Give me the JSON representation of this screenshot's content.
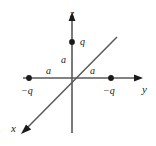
{
  "figure": {
    "background_color": "#ffffff",
    "axis_color": "#595959",
    "dot_color": "#1a1a1a",
    "text_color": "#1a1a1a",
    "width": 156,
    "height": 146
  },
  "axes": [
    {
      "name": "z",
      "label": "z",
      "direction": "up",
      "has_arrow": true
    },
    {
      "name": "y",
      "label": "y",
      "direction": "right",
      "has_arrow": true
    },
    {
      "name": "x",
      "label": "x",
      "direction": "down-left",
      "has_arrow": true
    }
  ],
  "charges": [
    {
      "id": "q-top",
      "label": "q",
      "axis": "z",
      "position": "+a",
      "sign": "positive"
    },
    {
      "id": "nq-left",
      "label": "−q",
      "axis": "y",
      "position": "−a",
      "sign": "negative"
    },
    {
      "id": "nq-right",
      "label": "−q",
      "axis": "y",
      "position": "+a",
      "sign": "negative"
    }
  ],
  "distances": [
    {
      "id": "a-z",
      "label": "a",
      "between": "origin to q on z-axis"
    },
    {
      "id": "a-left",
      "label": "a",
      "between": "origin to −q on −y side"
    },
    {
      "id": "a-right",
      "label": "a",
      "between": "origin to −q on +y side"
    }
  ]
}
